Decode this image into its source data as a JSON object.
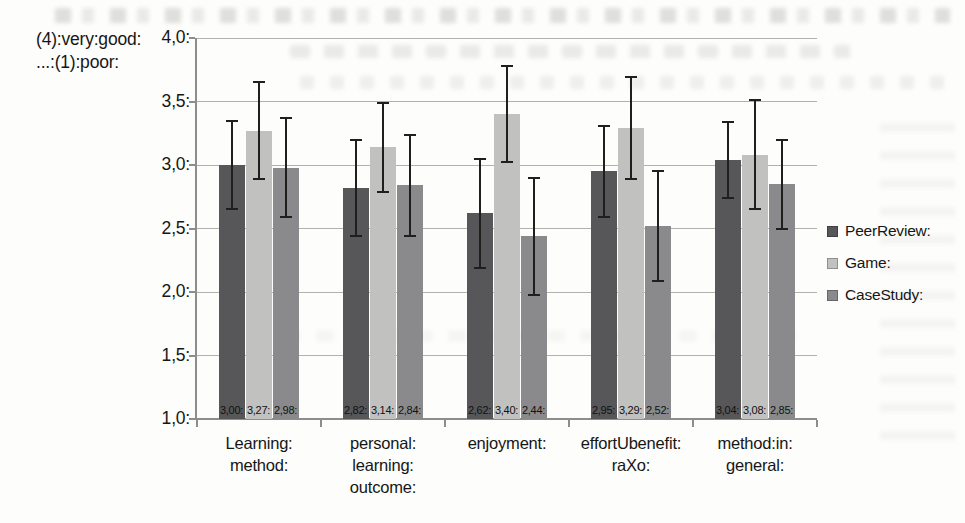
{
  "chart_data": {
    "type": "bar",
    "title": "",
    "y_axis_note": "(4):very:good:\n...:(1):poor:",
    "categories": [
      "Learning:\nmethod:",
      "personal:\nlearning:\noutcome:",
      "enjoyment:",
      "effortUbenefit:\nraXo:",
      "method:in:\ngeneral:"
    ],
    "series": [
      {
        "name": "PeerReview:",
        "color": "#57575a",
        "values": [
          3.0,
          2.82,
          2.62,
          2.95,
          3.04
        ],
        "value_labels": [
          "3,00:",
          "2,82:",
          "2,62:",
          "2,95:",
          "3,04:"
        ],
        "errors": [
          0.35,
          0.38,
          0.43,
          0.36,
          0.3
        ]
      },
      {
        "name": "Game:",
        "color": "#c1c1bf",
        "values": [
          3.27,
          3.14,
          3.4,
          3.29,
          3.08
        ],
        "value_labels": [
          "3,27:",
          "3,14:",
          "3,40:",
          "3,29:",
          "3,08:"
        ],
        "errors": [
          0.38,
          0.35,
          0.38,
          0.4,
          0.43
        ]
      },
      {
        "name": "CaseStudy:",
        "color": "#8a8a8c",
        "values": [
          2.98,
          2.84,
          2.44,
          2.52,
          2.85
        ],
        "value_labels": [
          "2,98:",
          "2,84:",
          "2,44:",
          "2,52:",
          "2,85:"
        ],
        "errors": [
          0.39,
          0.4,
          0.46,
          0.43,
          0.35
        ]
      }
    ],
    "ylim": [
      1.0,
      4.0
    ],
    "yticks": [
      {
        "value": 4.0,
        "label": "4,0:"
      },
      {
        "value": 3.5,
        "label": "3,5:"
      },
      {
        "value": 3.0,
        "label": "3,0:"
      },
      {
        "value": 2.5,
        "label": "2,5:"
      },
      {
        "value": 2.0,
        "label": "2,0:"
      },
      {
        "value": 1.5,
        "label": "1,5:"
      },
      {
        "value": 1.0,
        "label": "1,0:"
      }
    ],
    "grid": true,
    "legend_position": "right",
    "error_bars": true,
    "colors": {
      "gridline": "#b3b1ad",
      "axis": "#8f8d89",
      "error_bar": "#1f1f1f",
      "label_text": "#111111"
    }
  }
}
